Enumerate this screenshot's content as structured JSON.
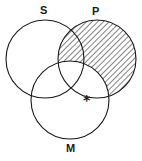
{
  "diagram": {
    "type": "venn",
    "sets": [
      {
        "id": "S",
        "label": "S",
        "cx": 45,
        "cy": 59,
        "r": 39
      },
      {
        "id": "P",
        "label": "P",
        "cx": 97,
        "cy": 59,
        "r": 39
      },
      {
        "id": "M",
        "label": "M",
        "cx": 70,
        "cy": 100,
        "r": 39
      }
    ],
    "shaded_regions": [
      "P not M"
    ],
    "marks": [
      {
        "symbol": "*",
        "region": "P and M, on P boundary, outside S"
      }
    ],
    "colors": {
      "stroke": "#1a1a1a",
      "hatch": "#1a1a1a",
      "background": "#ffffff"
    }
  }
}
